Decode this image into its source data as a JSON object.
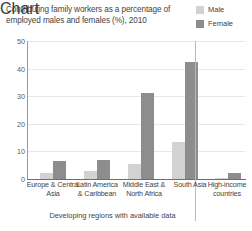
{
  "title": "Contributing family workers as a percentage of employed males and females (%), 2010",
  "legend": {
    "items": [
      {
        "label": "Male",
        "color": "#d2d2d2",
        "swatch_name": "legend-swatch-male"
      },
      {
        "label": "Female",
        "color": "#8d8d8d",
        "swatch_name": "legend-swatch-female"
      }
    ]
  },
  "axes": {
    "y_ticks": [
      "0",
      "10",
      "20",
      "30",
      "40",
      "50"
    ],
    "group_caption": "Developing regions with available data"
  },
  "chart_data": {
    "type": "bar",
    "title": "Contributing family workers as a percentage of employed males and females (%), 2010",
    "xlabel": "Developing regions with available data",
    "ylabel": "",
    "ylim": [
      0,
      50
    ],
    "yticks": [
      0,
      10,
      20,
      30,
      40,
      50
    ],
    "grid": true,
    "legend_position": "top-right",
    "categories": [
      "Europe & Central Asia",
      "Latin America & Caribbean",
      "Middle East & North Africa",
      "South Asia",
      "High-income countries"
    ],
    "series": [
      {
        "name": "Male",
        "color": "#d2d2d2",
        "values": [
          2.0,
          3.0,
          5.5,
          13.5,
          0.5
        ]
      },
      {
        "name": "Female",
        "color": "#8d8d8d",
        "values": [
          6.5,
          7.0,
          31.0,
          42.5,
          2.0
        ]
      }
    ],
    "annotations": [
      "Vertical separator drawn between 'South Asia' and 'High-income countries' to split developing regions from high-income countries."
    ]
  }
}
